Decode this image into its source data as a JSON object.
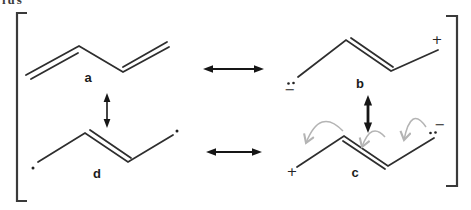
{
  "corner_fragment": "ius",
  "colors": {
    "background": "#ffffff",
    "bond": "#2e2e2e",
    "resonance_arrow": "#161616",
    "curved_arrow": "#b4b4b4",
    "bracket": "#3a3a3a"
  },
  "structures": {
    "a": {
      "label": "a"
    },
    "b": {
      "label": "b",
      "minus": "−",
      "plus": "+",
      "lone_pair": "two-dots"
    },
    "c": {
      "label": "c",
      "plus": "+",
      "minus": "−",
      "lone_pair": "two-dots"
    },
    "d": {
      "label": "d",
      "radicals": "single-dot-each-end"
    }
  },
  "arrows": {
    "a_b": "resonance-double-headed",
    "d_c": "resonance-double-headed",
    "a_d": "resonance-double-headed",
    "b_c": "resonance-double-headed",
    "curved": "electron-pushing-gray-x3"
  }
}
